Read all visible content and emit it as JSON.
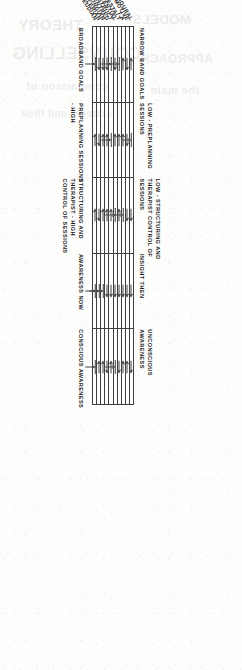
{
  "figure": {
    "type": "matrix-diagram",
    "orientation": "rotated-90-clockwise",
    "paper_tone": "#fdfdfc",
    "ink_color": "#1a1a1b",
    "rule_color": "#3f3f41"
  },
  "legend": {
    "up": "up-arrow",
    "down": "down-arrow",
    "neutral": "arrow-to-bar"
  },
  "chart_data": {
    "type": "table",
    "title": "",
    "xlabel": "",
    "ylabel": "",
    "row_header": "Therapeutic approach",
    "columns": [
      {
        "index": 0,
        "pole_a": "NARROW BAND GOALS",
        "pole_b": "BROADBAND GOALS"
      },
      {
        "index": 1,
        "pole_a": "LOW - PREPLANNING SESSIONS",
        "pole_b": "PREPLANNING SESSIONS - HIGH"
      },
      {
        "index": 2,
        "pole_a": "LOW - STRUCTURING AND THERAPIST CONTROL OF SESSIONS",
        "pole_b": "STRUCTURING AND THERAPIST - HIGH CONTROL OF SESSIONS"
      },
      {
        "index": 3,
        "pole_a": "INSIGHT THEN",
        "pole_b": "AWARENESS NOW"
      },
      {
        "index": 4,
        "pole_a": "UNCONSCIOUS AWARENESS",
        "pole_b": "CONSCIOUS AWARENESS"
      }
    ],
    "categories": [
      "BEHAVIOURAL",
      "RATIONAL-EMOTIVE",
      "T.A",
      "GESTALT",
      "EXISTENTIAL",
      "PERSONAL CONSTRUCT",
      "PERSON-CENTRED",
      "JUNGIAN",
      "ADLERIAN",
      "FREUDIAN"
    ],
    "cell_codes": [
      [
        "up",
        "neutral",
        "down",
        "down",
        "down"
      ],
      [
        "down",
        "down",
        "down",
        "down",
        "up"
      ],
      [
        "up",
        "up",
        "neutral",
        "down",
        "up"
      ],
      [
        "neutral",
        "up",
        "up",
        "down",
        "down"
      ],
      [
        "down",
        "up",
        "neutral",
        "down",
        "neutral"
      ],
      [
        "neutral",
        "neutral",
        "up",
        "down",
        "up"
      ],
      [
        "down",
        "up",
        "up",
        "down",
        "down"
      ],
      [
        "down",
        "up",
        "up",
        "neutral",
        "up"
      ],
      [
        "down",
        "down",
        "down",
        "neutral",
        "up"
      ],
      [
        "neutral",
        "up",
        "up",
        "neutral",
        "neutral"
      ]
    ]
  }
}
